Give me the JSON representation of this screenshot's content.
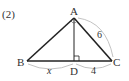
{
  "problem_label": "(2)",
  "points": {
    "A": {
      "label": "A",
      "x": 74,
      "y": 18
    },
    "B": {
      "label": "B",
      "x": 27,
      "y": 61
    },
    "C": {
      "label": "C",
      "x": 112,
      "y": 61
    },
    "D": {
      "label": "D",
      "x": 74,
      "y": 61
    }
  },
  "lengths": {
    "AC": "6",
    "BD": "x",
    "DC": "4"
  },
  "colors": {
    "stroke": "#222222",
    "arc": "#bbbbbb",
    "text": "#333333"
  }
}
